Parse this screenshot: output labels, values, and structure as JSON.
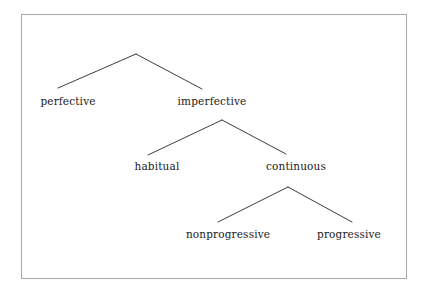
{
  "figure": {
    "type": "tree-diagram",
    "frame_color": "#a9a9a9",
    "line_color": "#262626",
    "text_color": "#1a1a1a",
    "background": "#ffffff"
  },
  "nodes": {
    "perfective": "perfective",
    "imperfective": "imperfective",
    "habitual": "habitual",
    "continuous": "continuous",
    "nonprogressive": "nonprogressive",
    "progressive": "progressive"
  },
  "chart_data": {
    "type": "tree",
    "title": "",
    "levels": [
      {
        "level": 1,
        "apex": {
          "x": 136,
          "y": 54
        },
        "children": [
          {
            "label": "perfective",
            "x": 58,
            "y": 88
          },
          {
            "label": "imperfective",
            "x": 202,
            "y": 89
          }
        ]
      },
      {
        "level": 2,
        "apex": {
          "x": 222,
          "y": 120
        },
        "parent": "imperfective",
        "children": [
          {
            "label": "habitual",
            "x": 148,
            "y": 155
          },
          {
            "label": "continuous",
            "x": 286,
            "y": 154
          }
        ]
      },
      {
        "level": 3,
        "apex": {
          "x": 288,
          "y": 187
        },
        "parent": "continuous",
        "children": [
          {
            "label": "nonprogressive",
            "x": 218,
            "y": 222
          },
          {
            "label": "progressive",
            "x": 352,
            "y": 222
          }
        ]
      }
    ],
    "labels": [
      {
        "text": "perfective",
        "cx": 68,
        "cy": 101
      },
      {
        "text": "imperfective",
        "cx": 212,
        "cy": 101
      },
      {
        "text": "habitual",
        "cx": 157,
        "cy": 166
      },
      {
        "text": "continuous",
        "cx": 296,
        "cy": 166
      },
      {
        "text": "nonprogressive",
        "cx": 228,
        "cy": 234
      },
      {
        "text": "progressive",
        "cx": 349,
        "cy": 234
      }
    ]
  }
}
